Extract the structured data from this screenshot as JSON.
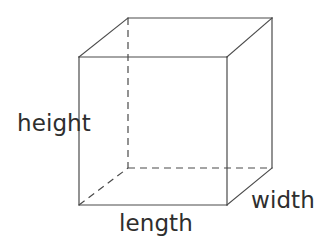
{
  "figure": {
    "background_color": "#ffffff",
    "line_color": "#4a4a4a",
    "text_color": "#2e2e2e",
    "line_width": 1.2,
    "dash_pattern": "7,5"
  },
  "labels": {
    "height": "height",
    "length": "length",
    "width": "width"
  },
  "geometry": {
    "projection": "oblique",
    "depth_offset_x": 45,
    "depth_offset_y": -39,
    "front_face": {
      "top_left": [
        79,
        57
      ],
      "top_right": [
        227,
        57
      ],
      "bottom_right": [
        227,
        205
      ],
      "bottom_left": [
        79,
        205
      ]
    },
    "back_face": {
      "top_left": [
        128,
        18
      ],
      "top_right": [
        272,
        18
      ],
      "bottom_right": [
        272,
        168
      ],
      "bottom_left": [
        128,
        168
      ]
    },
    "hidden_edges": [
      [
        [
          128,
          18
        ],
        [
          128,
          168
        ]
      ],
      [
        [
          128,
          168
        ],
        [
          272,
          168
        ]
      ],
      [
        [
          79,
          205
        ],
        [
          128,
          168
        ]
      ]
    ],
    "visible_edges": [
      [
        [
          79,
          57
        ],
        [
          227,
          57
        ]
      ],
      [
        [
          227,
          57
        ],
        [
          227,
          205
        ]
      ],
      [
        [
          227,
          205
        ],
        [
          79,
          205
        ]
      ],
      [
        [
          79,
          205
        ],
        [
          79,
          57
        ]
      ],
      [
        [
          128,
          18
        ],
        [
          272,
          18
        ]
      ],
      [
        [
          272,
          18
        ],
        [
          272,
          168
        ]
      ],
      [
        [
          79,
          57
        ],
        [
          128,
          18
        ]
      ],
      [
        [
          227,
          57
        ],
        [
          272,
          18
        ]
      ],
      [
        [
          227,
          205
        ],
        [
          272,
          168
        ]
      ]
    ]
  }
}
